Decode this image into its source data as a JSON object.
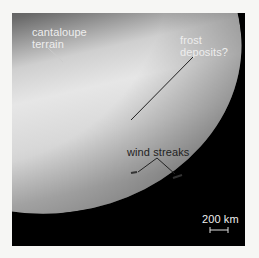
{
  "image": {
    "description": "Grayscale spacecraft image of a moon's southern hemisphere with annotations",
    "labels": {
      "cantaloupe_line1": "cantaloupe",
      "cantaloupe_line2": "terrain",
      "frost_line1": "frost",
      "frost_line2": "deposits?",
      "wind": "wind streaks",
      "scale": "200 km"
    }
  }
}
